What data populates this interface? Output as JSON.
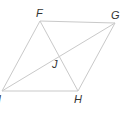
{
  "diagram": {
    "type": "parallelogram-with-diagonals",
    "colors": {
      "line": "#c9c9c9",
      "label": "#333333",
      "background": "#ffffff"
    },
    "points": {
      "F": {
        "label": "F",
        "x": 40,
        "y": 21
      },
      "G": {
        "label": "G",
        "x": 115,
        "y": 23
      },
      "H": {
        "label": "H",
        "x": 78,
        "y": 91
      },
      "I": {
        "label": "I",
        "x": 2,
        "y": 91
      },
      "J": {
        "label": "J",
        "x": 58,
        "y": 56
      }
    },
    "sides": [
      "FG",
      "GH",
      "HI",
      "IF"
    ],
    "diagonals": [
      "FH",
      "GI"
    ]
  }
}
